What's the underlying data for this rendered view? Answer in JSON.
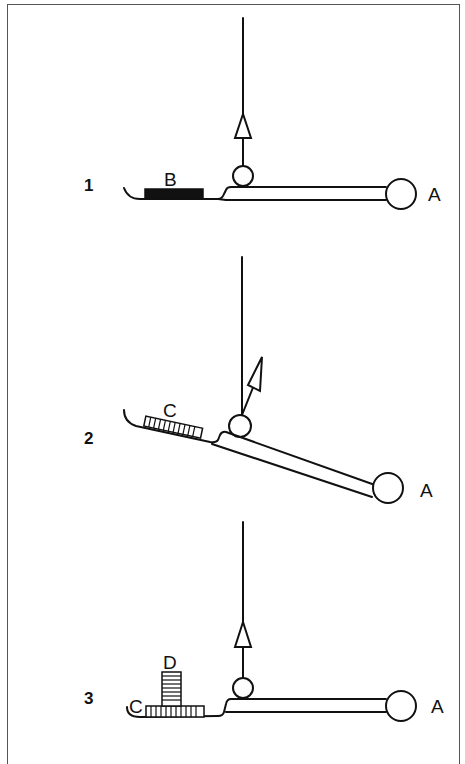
{
  "figure": {
    "colors": {
      "ink": "#111111",
      "frame": "#555555",
      "background": "#ffffff"
    }
  },
  "panels": [
    {
      "number": "1",
      "end_label": "A",
      "load_label": "B",
      "load_style": "solid-black-block",
      "arrow_direction": "vertical-up",
      "arm_state": "horizontal"
    },
    {
      "number": "2",
      "end_label": "A",
      "load_label": "C",
      "load_style": "hatched-block",
      "arrow_direction": "diagonal-up-right",
      "arm_state": "tilted-down-toward-A"
    },
    {
      "number": "3",
      "end_label": "A",
      "load_label": "C",
      "extra_load_label": "D",
      "load_style": "hatched-block-with-stacked-block",
      "arrow_direction": "vertical-up",
      "arm_state": "horizontal"
    }
  ]
}
